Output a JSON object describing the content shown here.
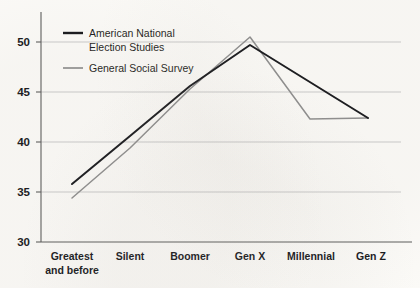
{
  "chart_data": {
    "type": "line",
    "title": "",
    "subtitle": "",
    "xlabel": "",
    "ylabel": "",
    "categories": [
      "Greatest\nand before",
      "Silent",
      "Boomer",
      "Gen X",
      "Millennial",
      "Gen Z"
    ],
    "category_lines": [
      [
        "Greatest",
        "and before"
      ],
      [
        "Silent"
      ],
      [
        "Boomer"
      ],
      [
        "Gen X"
      ],
      [
        "Millennial"
      ],
      [
        "Gen Z"
      ]
    ],
    "ylim": [
      30,
      52
    ],
    "yticks": [
      30,
      35,
      40,
      45,
      50
    ],
    "ytick_labels": [
      "30",
      "35",
      "40",
      "45",
      "50"
    ],
    "grid": true,
    "grid_color": "#c9c9c9",
    "legend_position": "top-left",
    "series": [
      {
        "name": "American National Election Studies",
        "name_lines": [
          "American National",
          "Election Studies"
        ],
        "color": "#16171b",
        "values": [
          35.8,
          40.6,
          45.6,
          49.7,
          null,
          42.4
        ],
        "defined_at": [
          true,
          true,
          true,
          true,
          false,
          true
        ]
      },
      {
        "name": "General Social Survey",
        "name_lines": [
          "General Social Survey"
        ],
        "color": "#8d8d8d",
        "values": [
          34.4,
          39.4,
          45.3,
          50.5,
          42.3,
          42.4
        ],
        "defined_at": [
          true,
          true,
          true,
          true,
          true,
          true
        ]
      }
    ]
  },
  "legend": {
    "items": [
      {
        "label_line1": "American National",
        "label_line2": "Election Studies",
        "color": "#16171b"
      },
      {
        "label_line1": "General Social Survey",
        "label_line2": "",
        "color": "#8d8d8d"
      }
    ]
  },
  "axis": {
    "y_tick_0": "30",
    "y_tick_1": "35",
    "y_tick_2": "40",
    "y_tick_3": "45",
    "y_tick_4": "50",
    "x_cat_0_line1": "Greatest",
    "x_cat_0_line2": "and before",
    "x_cat_1_line1": "Silent",
    "x_cat_2_line1": "Boomer",
    "x_cat_3_line1": "Gen X",
    "x_cat_4_line1": "Millennial",
    "x_cat_5_line1": "Gen Z"
  }
}
